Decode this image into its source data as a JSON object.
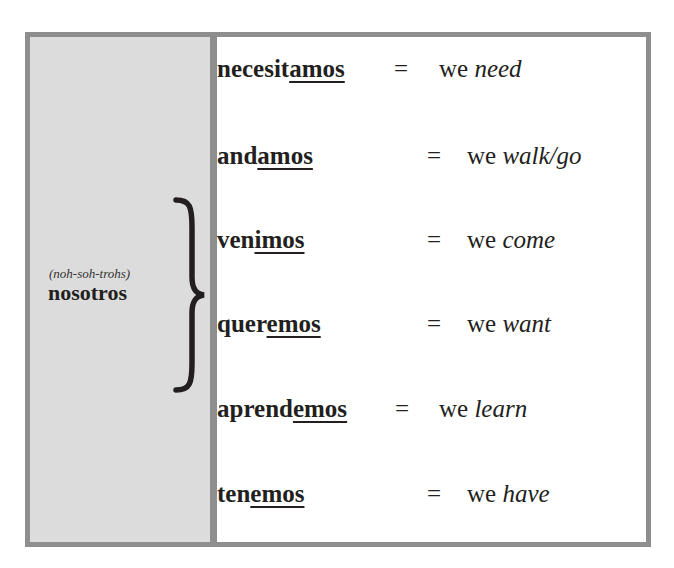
{
  "subject": {
    "pronunciation": "(noh-soh-trohs)",
    "pronoun": "nosotros"
  },
  "rows": [
    {
      "stem": "necesit",
      "ending": "amos",
      "equals": "=",
      "we": "we",
      "meaning": "need"
    },
    {
      "stem": "and",
      "ending": "amos",
      "equals": "=",
      "we": "we",
      "meaning": "walk/go"
    },
    {
      "stem": "ven",
      "ending": "imos",
      "equals": "=",
      "we": "we",
      "meaning": "come"
    },
    {
      "stem": "quer",
      "ending": "emos",
      "equals": "=",
      "we": "we",
      "meaning": "want"
    },
    {
      "stem": "aprend",
      "ending": "emos",
      "equals": "=",
      "we": "we",
      "meaning": "learn"
    },
    {
      "stem": "ten",
      "ending": "emos",
      "equals": "=",
      "we": "we",
      "meaning": "have"
    }
  ],
  "colors": {
    "border": "#8e8e8e",
    "left_panel": "#dcdcdc",
    "text": "#231f20"
  }
}
